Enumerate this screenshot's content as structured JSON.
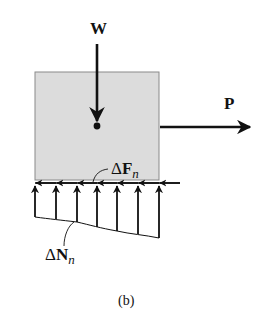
{
  "diagram": {
    "caption": "(b)",
    "block": {
      "fill": "#dcdcdc",
      "stroke": "#8a8a8a"
    },
    "forces": {
      "weight": {
        "label": "W",
        "direction": "down"
      },
      "applied": {
        "label": "P",
        "direction": "right"
      },
      "friction": {
        "delta": "Δ",
        "symbol": "F",
        "subscript": "n",
        "direction": "left"
      },
      "normal": {
        "delta": "Δ",
        "symbol": "N",
        "subscript": "n",
        "direction": "up",
        "count": 7
      }
    },
    "colors": {
      "ink": "#111111",
      "block_fill": "#dcdcdc"
    }
  }
}
